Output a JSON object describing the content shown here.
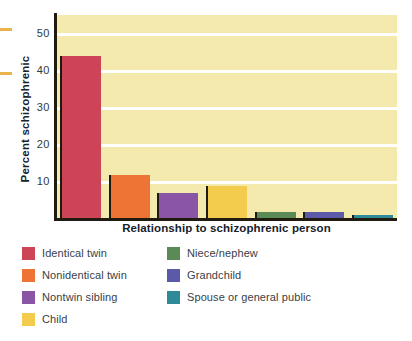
{
  "chart_data": {
    "type": "bar",
    "title": "",
    "subtitle": "",
    "xlabel": "Relationship to schizophrenic person",
    "ylabel": "Percent schizophrenic",
    "categories": [
      "Identical twin",
      "Nonidentical twin",
      "Nontwin sibling",
      "Child",
      "Niece/nephew",
      "Grandchild",
      "Spouse or general public"
    ],
    "values": [
      44,
      12,
      7,
      9,
      2,
      2,
      1
    ],
    "ylim": [
      0,
      55
    ],
    "yticks": [
      10,
      20,
      30,
      40,
      50
    ],
    "ytick_labels": [
      "10",
      "20",
      "30",
      "40",
      "50"
    ],
    "xtick_labels": [],
    "grid": true,
    "grid_color": "#FFFFFF",
    "legend_position": "below",
    "plot_background": "#F4EAAE",
    "bar_colors": [
      "#CC4455",
      "#EE7436",
      "#8B55A6",
      "#F3CB4D",
      "#5A8A56",
      "#5A5AA8",
      "#2E8A99"
    ]
  },
  "y_axis": {
    "title": "Percent schizophrenic",
    "ticks": [
      {
        "label": "50",
        "value": 50
      },
      {
        "label": "40",
        "value": 40
      },
      {
        "label": "30",
        "value": 30
      },
      {
        "label": "20",
        "value": 20
      },
      {
        "label": "10",
        "value": 10
      }
    ]
  },
  "x_axis": {
    "title": "Relationship to schizophrenic person"
  },
  "legend": {
    "left_column": [
      {
        "label": "Identical twin",
        "color": "#CC4455"
      },
      {
        "label": "Nonidentical twin",
        "color": "#EE7436"
      },
      {
        "label": "Nontwin sibling",
        "color": "#8B55A6"
      },
      {
        "label": "Child",
        "color": "#F3CB4D"
      }
    ],
    "right_column": [
      {
        "label": "Niece/nephew",
        "color": "#5A8A56"
      },
      {
        "label": "Grandchild",
        "color": "#5A5AA8"
      },
      {
        "label": "Spouse or general public",
        "color": "#2E8A99"
      }
    ]
  }
}
